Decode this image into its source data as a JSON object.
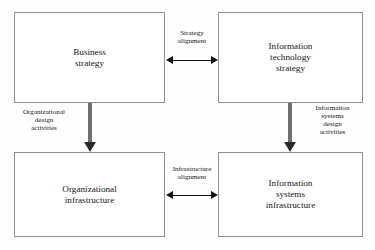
{
  "diagram": {
    "boxes": {
      "business_strategy": "Business\nstrategy",
      "it_strategy": "Information\ntechnology\nstrategy",
      "organizational_infrastructure": "Organizational\ninfrastructure",
      "is_infrastructure": "Information\nsystems\ninfrastructure"
    },
    "connectors": {
      "strategy_alignment": "Strategy\nalignment",
      "infrastructure_alignment": "Infrastructure\nalignment",
      "organizational_design_activities": "Organizational\ndesign\nactivities",
      "is_design_activities": "Information\nsystems\ndesign\nactivities"
    },
    "colors": {
      "background": "#fefefe",
      "box_border": "#8e8e96",
      "box_fill": "#ffffff",
      "text": "#15151a",
      "thin_arrow": "#101014",
      "thick_arrow_shaft": "#6d6d72",
      "thick_arrow_head": "#2a2a2e"
    }
  }
}
